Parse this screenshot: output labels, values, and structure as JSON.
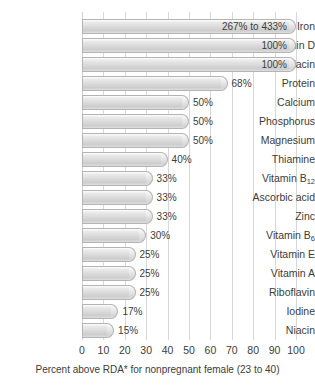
{
  "chart_data": {
    "type": "bar",
    "orientation": "horizontal",
    "title": "",
    "subtitle": "",
    "xlabel": "Percent above RDA* for nonpregnant female (23 to 40)",
    "ylabel": "",
    "xlim": [
      0,
      100
    ],
    "xticks": [
      0,
      10,
      20,
      30,
      40,
      50,
      60,
      70,
      80,
      90,
      100
    ],
    "xtick_labels": [
      "0",
      "10",
      "20",
      "30",
      "40",
      "50",
      "60",
      "70",
      "80",
      "90",
      "100"
    ],
    "grid": true,
    "grid_axis": "x",
    "legend": false,
    "legend_position": "none",
    "bar_color": "#d9d9d9",
    "bar_edge_color": "#b4b4b4",
    "grid_color": "#d8d8d8",
    "text_color": "#3c3c3c",
    "categories": [
      "Iron",
      "Vitamin D",
      "Folacin",
      "Protein",
      "Calcium",
      "Phosphorus",
      "Magnesium",
      "Thiamine",
      "Vitamin B12",
      "Ascorbic acid",
      "Zinc",
      "Vitamin B6",
      "Vitamin E",
      "Vitamin A",
      "Riboflavin",
      "Iodine",
      "Niacin"
    ],
    "values": [
      100,
      100,
      100,
      68,
      50,
      50,
      50,
      40,
      33,
      33,
      33,
      30,
      25,
      25,
      25,
      17,
      15
    ],
    "data_labels": [
      "267% to 433%",
      "100%",
      "100%",
      "68%",
      "50%",
      "50%",
      "50%",
      "40%",
      "33%",
      "33%",
      "33%",
      "30%",
      "25%",
      "25%",
      "25%",
      "17%",
      "15%"
    ]
  },
  "rows": [
    {
      "label_main": "Iron",
      "label_sub": "",
      "value": 100,
      "data_label": "267% to 433%",
      "label_pos": "inside"
    },
    {
      "label_main": "Vitamin D",
      "label_sub": "",
      "value": 100,
      "data_label": "100%",
      "label_pos": "inside"
    },
    {
      "label_main": "Folacin",
      "label_sub": "",
      "value": 100,
      "data_label": "100%",
      "label_pos": "inside"
    },
    {
      "label_main": "Protein",
      "label_sub": "",
      "value": 68,
      "data_label": "68%",
      "label_pos": "outside"
    },
    {
      "label_main": "Calcium",
      "label_sub": "",
      "value": 50,
      "data_label": "50%",
      "label_pos": "outside"
    },
    {
      "label_main": "Phosphorus",
      "label_sub": "",
      "value": 50,
      "data_label": "50%",
      "label_pos": "outside"
    },
    {
      "label_main": "Magnesium",
      "label_sub": "",
      "value": 50,
      "data_label": "50%",
      "label_pos": "outside"
    },
    {
      "label_main": "Thiamine",
      "label_sub": "",
      "value": 40,
      "data_label": "40%",
      "label_pos": "outside"
    },
    {
      "label_main": "Vitamin B",
      "label_sub": "12",
      "value": 33,
      "data_label": "33%",
      "label_pos": "outside"
    },
    {
      "label_main": "Ascorbic acid",
      "label_sub": "",
      "value": 33,
      "data_label": "33%",
      "label_pos": "outside"
    },
    {
      "label_main": "Zinc",
      "label_sub": "",
      "value": 33,
      "data_label": "33%",
      "label_pos": "outside"
    },
    {
      "label_main": "Vitamin B",
      "label_sub": "6",
      "value": 30,
      "data_label": "30%",
      "label_pos": "outside"
    },
    {
      "label_main": "Vitamin E",
      "label_sub": "",
      "value": 25,
      "data_label": "25%",
      "label_pos": "outside"
    },
    {
      "label_main": "Vitamin A",
      "label_sub": "",
      "value": 25,
      "data_label": "25%",
      "label_pos": "outside"
    },
    {
      "label_main": "Riboflavin",
      "label_sub": "",
      "value": 25,
      "data_label": "25%",
      "label_pos": "outside"
    },
    {
      "label_main": "Iodine",
      "label_sub": "",
      "value": 17,
      "data_label": "17%",
      "label_pos": "outside"
    },
    {
      "label_main": "Niacin",
      "label_sub": "",
      "value": 15,
      "data_label": "15%",
      "label_pos": "outside"
    }
  ],
  "axis": {
    "title": "Percent above RDA* for nonpregnant female (23 to 40)",
    "ticks": [
      "0",
      "10",
      "20",
      "30",
      "40",
      "50",
      "60",
      "70",
      "80",
      "90",
      "100"
    ]
  }
}
